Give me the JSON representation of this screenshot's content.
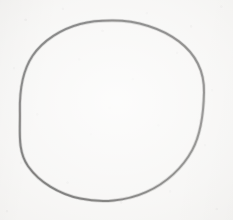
{
  "image": {
    "kind": "scanned-drawing",
    "subject": "hand-drawn circle",
    "width": 233,
    "height": 220,
    "alt_text": "A single large hand-drawn circle outlined in dark ink on lightly textured off-white paper",
    "caption": "",
    "visible_text": "",
    "medium": "ink on paper, scanned"
  },
  "background": {
    "name": "paper-sheet",
    "base_color": "#f2f1ef",
    "highlight_color": "#fbfbfa",
    "shadow_color": "#e3e2df",
    "texture": "fine speckled grain"
  },
  "shapes": [
    {
      "name": "hand-drawn-circle",
      "type": "circle",
      "stroke_color": "#1d1c1b",
      "fill": "none",
      "stroke_width": 2.0,
      "center_x": 112,
      "center_y": 111,
      "radius_x": 92,
      "radius_y": 90.5,
      "closed": true,
      "hand_drawn": true,
      "path": "M 112.0 20.6 C 137.0 20.4 161.4 28.2 178.9 41.4 C 196.3 54.7 204.4 73.1 204.0 92.4 C 203.6 112.2 201.6 132.6 192.2 150.1 C 182.8 167.6 166.2 183.3 146.0 192.2 C 125.8 201.2 101.8 203.3 80.3 198.6 C 58.7 193.9 39.1 182.0 28.1 166.2 C 17.0 150.4 20.4 130.9 19.9 111.2 C 19.5 91.4 22.1 71.4 32.6 55.8 C 43.1 40.3 61.6 28.9 80.2 24.0 C 90.8 21.2 101.4 20.6 112.0 20.6 Z"
    }
  ],
  "annotations": [],
  "colors": {
    "ink": "#1d1c1b",
    "paper": "#f2f1ef"
  }
}
